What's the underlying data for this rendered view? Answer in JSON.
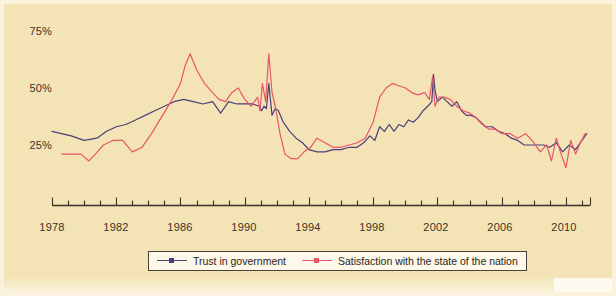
{
  "figure": {
    "background_color": "#f4e3b4",
    "axis_color": "#3b3328"
  },
  "legend": {
    "items": [
      {
        "label": "Trust in government",
        "color": "#4a3f7a",
        "marker": "square-marker"
      },
      {
        "label": "Satisfaction with the state of the nation",
        "color": "#e8566a",
        "marker": "square-marker"
      }
    ]
  },
  "yaxis": {
    "ticks": [
      "75%",
      "50%",
      "25%"
    ]
  },
  "xaxis": {
    "ticks": [
      "1978",
      "1982",
      "1986",
      "1990",
      "1994",
      "1998",
      "2002",
      "2006",
      "2010"
    ]
  },
  "chart_data": {
    "type": "line",
    "title": "",
    "subtitle": "",
    "xlabel": "",
    "ylabel": "",
    "xlim": [
      1978,
      2011.5
    ],
    "ylim": [
      0,
      82
    ],
    "ytick_values": [
      25,
      50,
      75
    ],
    "ytick_labels": [
      "25%",
      "50%",
      "75%"
    ],
    "xtick_values": [
      1978,
      1982,
      1986,
      1990,
      1994,
      1998,
      2002,
      2006,
      2010
    ],
    "xtick_labels": [
      "1978",
      "1982",
      "1986",
      "1990",
      "1994",
      "1998",
      "2002",
      "2006",
      "2010"
    ],
    "minor_xticks_every": 1,
    "grid": false,
    "legend_position": "bottom-center",
    "series": [
      {
        "name": "Trust in government",
        "color": "#4a3f7a",
        "x": [
          1978.0,
          1978.6,
          1979.2,
          1980.0,
          1980.8,
          1981.4,
          1982.0,
          1982.6,
          1983.2,
          1983.8,
          1984.4,
          1985.0,
          1985.6,
          1986.2,
          1986.8,
          1987.4,
          1988.0,
          1988.5,
          1989.0,
          1989.5,
          1990.0,
          1990.5,
          1990.9,
          1991.05,
          1991.2,
          1991.35,
          1991.5,
          1991.7,
          1991.9,
          1992.1,
          1992.4,
          1992.8,
          1993.2,
          1993.6,
          1994.0,
          1994.5,
          1995.0,
          1995.5,
          1996.0,
          1996.5,
          1997.0,
          1997.4,
          1997.8,
          1998.1,
          1998.4,
          1998.7,
          1999.0,
          1999.3,
          1999.6,
          1999.9,
          2000.2,
          2000.5,
          2000.8,
          2001.1,
          2001.4,
          2001.65,
          2001.75,
          2001.85,
          2002.0,
          2002.3,
          2002.6,
          2002.9,
          2003.2,
          2003.5,
          2003.8,
          2004.1,
          2004.4,
          2004.7,
          2005.0,
          2005.4,
          2005.8,
          2006.2,
          2006.6,
          2007.0,
          2007.4,
          2007.8,
          2008.2,
          2008.6,
          2009.0,
          2009.4,
          2009.8,
          2010.2,
          2010.6,
          2011.0,
          2011.3
        ],
        "y": [
          31,
          30,
          29,
          27,
          28,
          31,
          33,
          34,
          36,
          38,
          40,
          42,
          44,
          45,
          44,
          43,
          44,
          39,
          44,
          43,
          43,
          43,
          42,
          40,
          42,
          41,
          52,
          38,
          41,
          40,
          35,
          31,
          28,
          26,
          23,
          22,
          22,
          23,
          23,
          24,
          24,
          26,
          29,
          27,
          33,
          31,
          34,
          31,
          34,
          33,
          36,
          35,
          37,
          40,
          42,
          44,
          56,
          49,
          44,
          46,
          44,
          42,
          44,
          40,
          38,
          38,
          37,
          35,
          33,
          33,
          31,
          30,
          28,
          27,
          25,
          25,
          25,
          25,
          24,
          26,
          22,
          25,
          23,
          27,
          30
        ],
        "marker": "none",
        "linewidth": 1.2
      },
      {
        "name": "Satisfaction with the state of the nation",
        "color": "#e8566a",
        "x": [
          1978.6,
          1979.2,
          1979.8,
          1980.3,
          1980.7,
          1981.2,
          1981.8,
          1982.4,
          1983.0,
          1983.6,
          1984.2,
          1984.8,
          1985.4,
          1986.0,
          1986.3,
          1986.6,
          1987.0,
          1987.5,
          1988.0,
          1988.4,
          1988.8,
          1989.2,
          1989.6,
          1990.0,
          1990.4,
          1990.8,
          1990.95,
          1991.1,
          1991.3,
          1991.5,
          1991.7,
          1991.9,
          1992.2,
          1992.5,
          1992.9,
          1993.3,
          1993.7,
          1994.1,
          1994.5,
          1995.0,
          1995.5,
          1996.0,
          1996.5,
          1997.0,
          1997.5,
          1998.0,
          1998.4,
          1998.8,
          1999.2,
          1999.6,
          2000.0,
          2000.4,
          2000.8,
          2001.2,
          2001.5,
          2001.7,
          2001.85,
          2002.1,
          2002.4,
          2002.8,
          2003.2,
          2003.6,
          2004.0,
          2004.4,
          2004.8,
          2005.2,
          2005.6,
          2006.0,
          2006.5,
          2007.0,
          2007.5,
          2008.0,
          2008.4,
          2008.8,
          2009.1,
          2009.4,
          2009.7,
          2010.0,
          2010.3,
          2010.6,
          2010.9,
          2011.2
        ],
        "y": [
          21,
          21,
          21,
          18,
          21,
          25,
          27,
          27,
          22,
          24,
          30,
          37,
          44,
          52,
          60,
          65,
          58,
          52,
          48,
          45,
          44,
          48,
          50,
          45,
          42,
          46,
          40,
          52,
          44,
          65,
          48,
          42,
          30,
          21,
          19,
          19,
          22,
          24,
          28,
          26,
          24,
          24,
          25,
          26,
          28,
          35,
          46,
          50,
          52,
          51,
          50,
          48,
          47,
          48,
          45,
          55,
          42,
          46,
          46,
          45,
          42,
          40,
          39,
          37,
          34,
          32,
          32,
          30,
          30,
          28,
          30,
          26,
          22,
          25,
          18,
          28,
          21,
          15,
          27,
          21,
          26,
          30
        ],
        "marker": "none",
        "linewidth": 1.2
      }
    ]
  }
}
